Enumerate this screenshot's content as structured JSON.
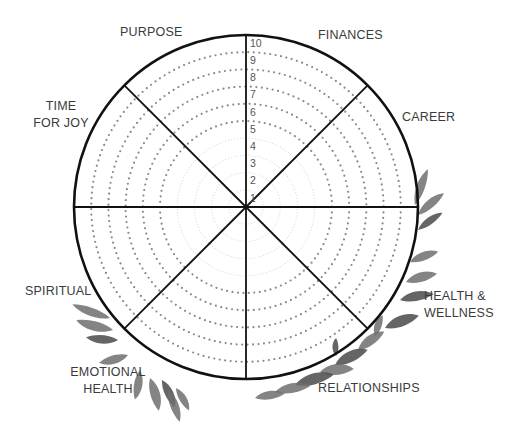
{
  "wheel": {
    "title": "Wheel of Life",
    "center": [
      246,
      207
    ],
    "outer_radius": 172,
    "scale": [
      "1",
      "2",
      "3",
      "4",
      "5",
      "6",
      "7",
      "8",
      "9",
      "10"
    ],
    "segments": 8,
    "colors": {
      "outline": "#111111",
      "dots": "#8a8a8a",
      "faint_rings": "#d8d8d8",
      "leaf": "#6e6e6e",
      "leaf_dark": "#4a4a4a",
      "text": "#3b3b3b"
    }
  },
  "categories": [
    {
      "id": "purpose",
      "lines": [
        "PURPOSE"
      ]
    },
    {
      "id": "finances",
      "lines": [
        "FINANCES"
      ]
    },
    {
      "id": "career",
      "lines": [
        "CAREER"
      ]
    },
    {
      "id": "health-wellness",
      "lines": [
        "HEALTH &",
        "WELLNESS"
      ]
    },
    {
      "id": "relationships",
      "lines": [
        "RELATIONSHIPS"
      ]
    },
    {
      "id": "emotional-health",
      "lines": [
        "EMOTIONAL",
        "HEALTH"
      ]
    },
    {
      "id": "spiritual",
      "lines": [
        "SPIRITUAL"
      ]
    },
    {
      "id": "time-for-joy",
      "lines": [
        "TIME",
        "FOR JOY"
      ]
    }
  ]
}
